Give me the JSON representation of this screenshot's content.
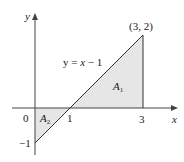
{
  "diagram": {
    "axes": {
      "x_label": "x",
      "y_label": "y"
    },
    "ticks": {
      "origin": "0",
      "x1": "1",
      "x3": "3",
      "y_neg1": "−1"
    },
    "point_label": "(3, 2)",
    "curve_label_prefix": "y = ",
    "curve_label_x": "x",
    "curve_label_suffix": " − 1",
    "regions": [
      {
        "name": "A",
        "sub": "1"
      },
      {
        "name": "A",
        "sub": "2"
      }
    ],
    "colors": {
      "fill": "#e8e8e8",
      "stroke": "#333333"
    }
  }
}
